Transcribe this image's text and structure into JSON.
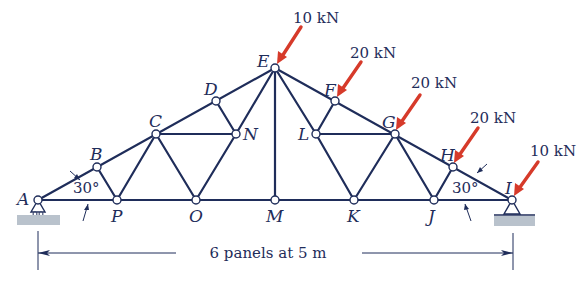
{
  "figure": {
    "type": "roof truss",
    "colors": {
      "members": "#1f2d5a",
      "loads": "#d63a2a",
      "ground": "#b9c2cc"
    },
    "joints": [
      {
        "id": "A",
        "label": "A"
      },
      {
        "id": "B",
        "label": "B"
      },
      {
        "id": "C",
        "label": "C"
      },
      {
        "id": "D",
        "label": "D"
      },
      {
        "id": "E",
        "label": "E"
      },
      {
        "id": "F",
        "label": "F"
      },
      {
        "id": "G",
        "label": "G"
      },
      {
        "id": "H",
        "label": "H"
      },
      {
        "id": "I",
        "label": "I"
      },
      {
        "id": "J",
        "label": "J"
      },
      {
        "id": "K",
        "label": "K"
      },
      {
        "id": "L",
        "label": "L"
      },
      {
        "id": "M",
        "label": "M"
      },
      {
        "id": "N",
        "label": "N"
      },
      {
        "id": "O",
        "label": "O"
      },
      {
        "id": "P",
        "label": "P"
      }
    ],
    "loads": [
      {
        "joint": "E",
        "label": "10 kN"
      },
      {
        "joint": "F",
        "label": "20 kN"
      },
      {
        "joint": "G",
        "label": "20 kN"
      },
      {
        "joint": "H",
        "label": "20 kN"
      },
      {
        "joint": "I",
        "label": "10 kN"
      }
    ],
    "angles": {
      "left": "30°",
      "right": "30°"
    },
    "dimension": {
      "label": "6 panels at 5 m"
    }
  }
}
